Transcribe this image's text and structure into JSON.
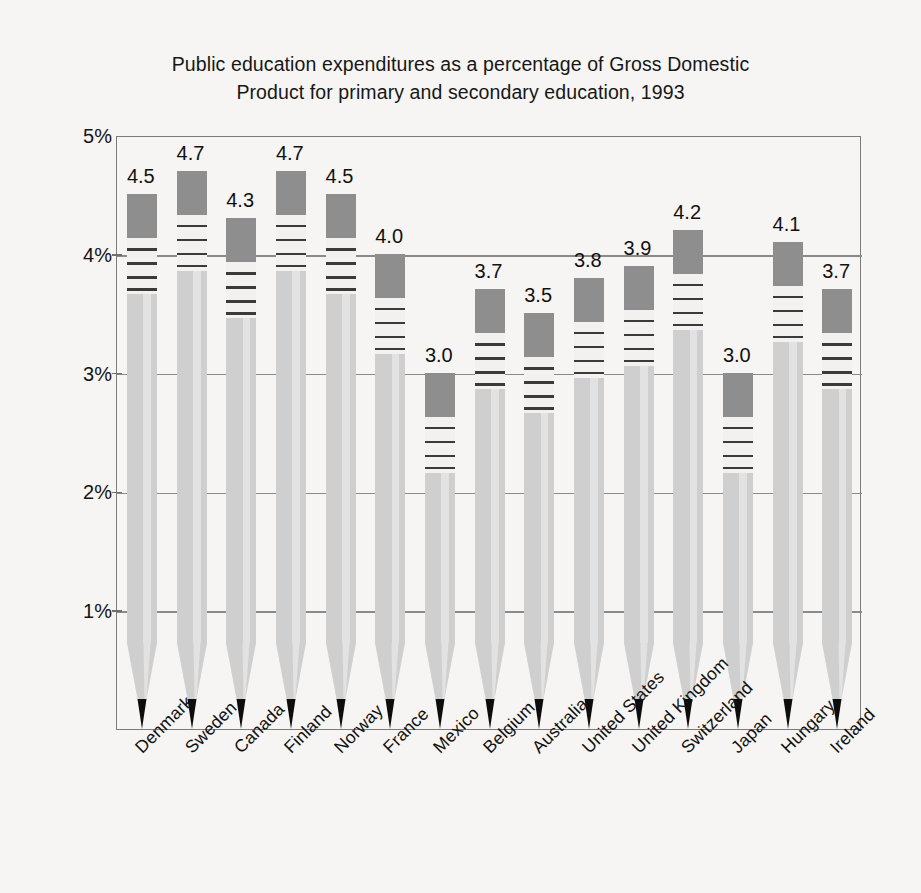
{
  "chart_data": {
    "type": "bar",
    "title": "Public education expenditures as a percentage of Gross Domestic\nProduct for primary and secondary education, 1993",
    "xlabel": "",
    "ylabel": "",
    "ylim": [
      0,
      5
    ],
    "ytick_labels": [
      "5%",
      "4%",
      "3%",
      "2%",
      "1%"
    ],
    "ytick_values": [
      5,
      4,
      3,
      2,
      1
    ],
    "grid": true,
    "legend": "none",
    "categories": [
      "Denmark",
      "Sweden",
      "Canada",
      "Finland",
      "Norway",
      "France",
      "Mexico",
      "Belgium",
      "Australia",
      "United States",
      "United Kingdom",
      "Switzerland",
      "Japan",
      "Hungary",
      "Ireland"
    ],
    "values": [
      4.5,
      4.7,
      4.3,
      4.7,
      4.5,
      4.0,
      3.0,
      3.7,
      3.5,
      3.8,
      3.9,
      4.2,
      3.0,
      4.1,
      3.7
    ],
    "data_labels": [
      "4.5",
      "4.7",
      "4.3",
      "4.7",
      "4.5",
      "4.0",
      "3.0",
      "3.7",
      "3.5",
      "3.8",
      "3.9",
      "4.2",
      "3.0",
      "4.1",
      "3.7"
    ],
    "marker_style": "pencil",
    "colors": {
      "eraser": "#8e8e8e",
      "ferrule": "#f2f1ef",
      "ferrule_band": "#3a3a3a",
      "body": "#cfcfcf",
      "body_highlight": "#e2e2e2",
      "wood": "#d8d8d8",
      "graphite": "#0d0d0d",
      "gridline": "#8a8a8a",
      "frame": "#7b7b7b",
      "background": "#f6f5f3",
      "text": "#111111"
    }
  }
}
